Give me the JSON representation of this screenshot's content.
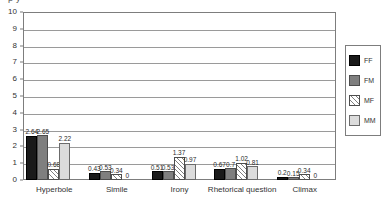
{
  "clipped_header_text": "p  y",
  "chart_data": {
    "type": "bar",
    "title": "",
    "subtitle": "",
    "xlabel": "",
    "ylabel": "",
    "ylim": [
      0,
      10
    ],
    "ytick_labels": [
      "0",
      "1",
      "2",
      "3",
      "4",
      "5",
      "6",
      "7",
      "8",
      "9",
      "10"
    ],
    "yticks": [
      0,
      1,
      2,
      3,
      4,
      5,
      6,
      7,
      8,
      9,
      10
    ],
    "grid": "horizontal",
    "legend_position": "right-outside",
    "categories": [
      "Hyperbole",
      "Simile",
      "Irony",
      "Rhetorical question",
      "Climax"
    ],
    "series": [
      {
        "name": "FF",
        "color": "#1a1a1a",
        "values": [
          2.64,
          0.43,
          0.51,
          0.67,
          0.2
        ],
        "labels": [
          "2.64",
          "0.43",
          "0.51",
          "0.67",
          "0.2"
        ]
      },
      {
        "name": "FM",
        "color": "#7f7f7f",
        "values": [
          2.65,
          0.53,
          0.53,
          0.7,
          0.15
        ],
        "labels": [
          "2.65",
          "0.53",
          "0.53",
          "0.7",
          "0.15"
        ]
      },
      {
        "name": "MF",
        "color": "#ffffff",
        "pattern": "diagonal-hatch",
        "values": [
          0.68,
          0.34,
          1.37,
          1.02,
          0.34
        ],
        "labels": [
          "0.68",
          "0.34",
          "1.37",
          "1.02",
          "0.34"
        ]
      },
      {
        "name": "MM",
        "color": "#dcdcdc",
        "values": [
          2.22,
          0,
          0.97,
          0.81,
          0
        ],
        "labels": [
          "2.22",
          "0",
          "0.97",
          "0.81",
          "0"
        ]
      }
    ]
  },
  "legend": {
    "items": [
      {
        "label": "FF"
      },
      {
        "label": "FM"
      },
      {
        "label": "MF"
      },
      {
        "label": "MM"
      }
    ]
  }
}
